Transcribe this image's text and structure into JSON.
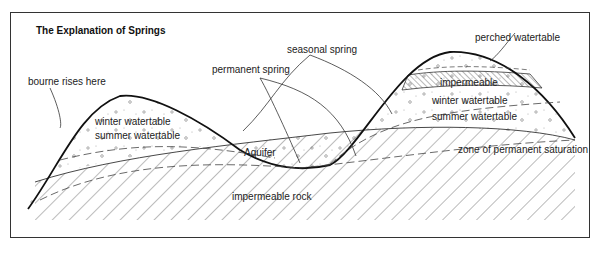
{
  "title": "The Explanation of Springs",
  "labels": {
    "bourne": "bourne rises here",
    "permanent_spring": "permanent spring",
    "seasonal_spring": "seasonal spring",
    "perched_watertable": "perched watertable",
    "impermeable": "impermeable",
    "winter_watertable_left": "winter watertable",
    "summer_watertable_left": "summer watertable",
    "winter_watertable_right": "winter watertable",
    "summer_watertable_right": "summer watertable",
    "aquifer": "Aquifer",
    "zone_saturation": "zone of permanent saturation",
    "impermeable_rock": "impermeable rock"
  }
}
